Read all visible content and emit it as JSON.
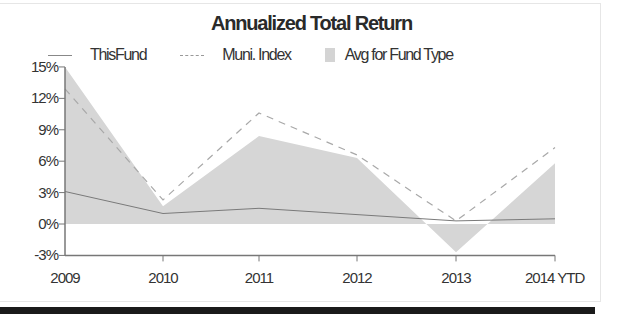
{
  "chart_data": {
    "type": "line",
    "title": "Annualized Total Return",
    "categories": [
      "2009",
      "2010",
      "2011",
      "2012",
      "2013",
      "2014 YTD"
    ],
    "series": [
      {
        "name": "This Fund",
        "style": "solid-line",
        "values": [
          3.1,
          1.0,
          1.5,
          0.9,
          0.3,
          0.5
        ]
      },
      {
        "name": "Muni. Index",
        "style": "dashed-line",
        "values": [
          12.9,
          2.3,
          10.6,
          6.6,
          0.3,
          7.3
        ]
      },
      {
        "name": "Avg for Fund Type",
        "style": "shaded-area",
        "values": [
          15.0,
          1.7,
          8.4,
          6.3,
          -2.7,
          5.8
        ]
      }
    ],
    "xlabel": "",
    "ylabel": "",
    "ylim": [
      -3,
      15
    ],
    "yticks": [
      "15%",
      "12%",
      "9%",
      "6%",
      "3%",
      "0%",
      "-3%"
    ],
    "ytick_values": [
      15,
      12,
      9,
      6,
      3,
      0,
      -3
    ],
    "grid": false,
    "legend_position": "top"
  },
  "legend": [
    {
      "label": "ThisFund"
    },
    {
      "label": "Muni. Index"
    },
    {
      "label": "Avg for Fund Type"
    }
  ],
  "colors": {
    "fund_line": "#7a7a7a",
    "index_line": "#a8a8a8",
    "avg_fill": "#d6d6d6",
    "axis": "#777777"
  }
}
